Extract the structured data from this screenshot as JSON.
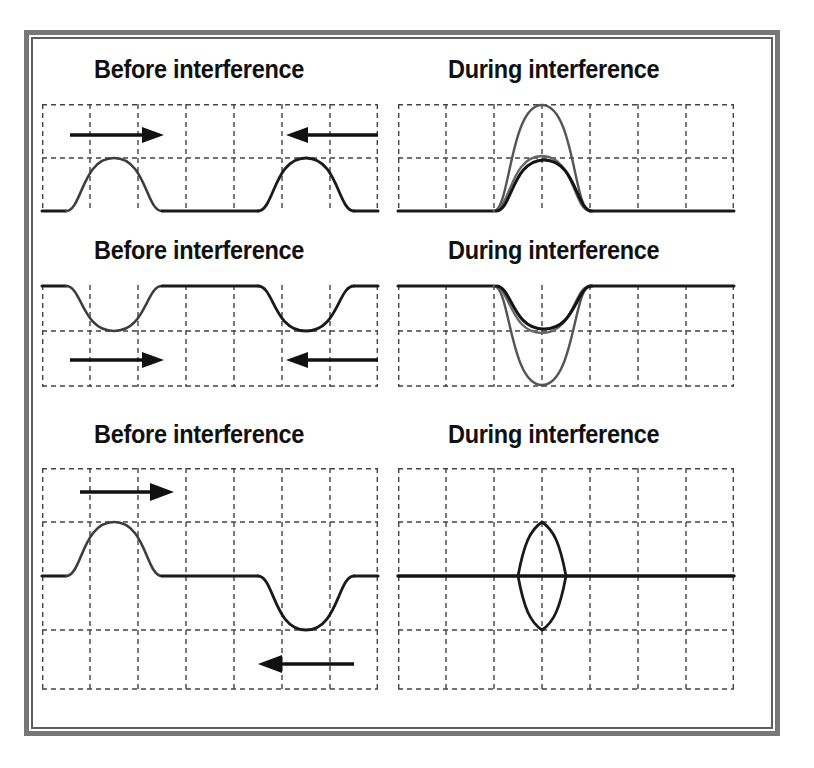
{
  "figure": {
    "kind": "wave-interference-diagram",
    "background": "#ffffff",
    "frame_color": "#6b6b6b",
    "line_color": "#1a1a1a",
    "grid_color": "#444444",
    "resultant_color": "#111111",
    "component_color": "#555555"
  },
  "rows": [
    {
      "id": "row-constructive-crest",
      "before": {
        "title": "Before interference",
        "description": "Two identical upward pulses approaching each other on a flat baseline",
        "baseline_position": "bottom",
        "pulses": [
          {
            "name": "left-pulse",
            "direction": "right",
            "polarity": "crest",
            "amplitude": 1,
            "center_cell": 1.5
          },
          {
            "name": "right-pulse",
            "direction": "left",
            "polarity": "crest",
            "amplitude": 1,
            "center_cell": 5.5
          }
        ],
        "arrows": [
          {
            "name": "left-arrow",
            "direction": "right"
          },
          {
            "name": "right-arrow",
            "direction": "left"
          }
        ]
      },
      "during": {
        "title": "During interference",
        "description": "Pulses overlap; resultant amplitude is the sum of the two crests",
        "baseline_position": "bottom",
        "components": 2,
        "resultant_amplitude": 2,
        "component_amplitude": 1,
        "interference_type": "constructive"
      }
    },
    {
      "id": "row-constructive-trough",
      "before": {
        "title": "Before interference",
        "description": "Two identical downward pulses approaching each other on a flat baseline",
        "baseline_position": "top",
        "pulses": [
          {
            "name": "left-pulse",
            "direction": "right",
            "polarity": "trough",
            "amplitude": 1,
            "center_cell": 1.5
          },
          {
            "name": "right-pulse",
            "direction": "left",
            "polarity": "trough",
            "amplitude": 1,
            "center_cell": 5.5
          }
        ],
        "arrows": [
          {
            "name": "left-arrow",
            "direction": "right"
          },
          {
            "name": "right-arrow",
            "direction": "left"
          }
        ]
      },
      "during": {
        "title": "During interference",
        "description": "Pulses overlap; resultant depth is the sum of the two troughs",
        "baseline_position": "top",
        "components": 2,
        "resultant_amplitude": 2,
        "component_amplitude": 1,
        "interference_type": "constructive"
      }
    },
    {
      "id": "row-destructive",
      "before": {
        "title": "Before interference",
        "description": "An upward pulse and a downward pulse approaching each other on a central baseline",
        "baseline_position": "middle",
        "pulses": [
          {
            "name": "left-pulse",
            "direction": "right",
            "polarity": "crest",
            "amplitude": 1,
            "center_cell": 1.5
          },
          {
            "name": "right-pulse",
            "direction": "left",
            "polarity": "trough",
            "amplitude": 1,
            "center_cell": 5.5
          }
        ],
        "arrows": [
          {
            "name": "left-arrow",
            "direction": "right"
          },
          {
            "name": "right-arrow",
            "direction": "left"
          }
        ]
      },
      "during": {
        "title": "During interference",
        "description": "Crest and trough overlap; the two pulses cancel along the baseline leaving a lens shape",
        "baseline_position": "middle",
        "components": 2,
        "resultant_amplitude": 0,
        "component_amplitude": 1,
        "interference_type": "destructive"
      }
    }
  ]
}
